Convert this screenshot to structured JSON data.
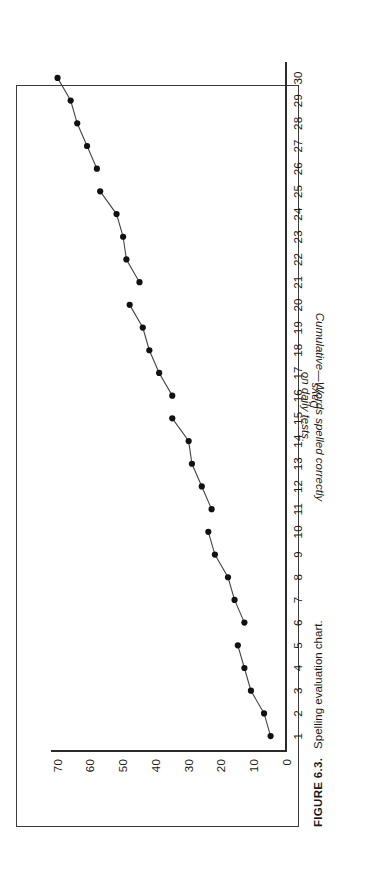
{
  "figure": {
    "caption_number": "FIGURE 6.3.",
    "caption_text": "Spelling evaluation chart.",
    "frame_color": "#3c3c3c",
    "rotation_note": "90-ccw"
  },
  "chart_data": {
    "type": "line",
    "title": "",
    "xlabel": "Days",
    "ylabel": "Cumulative—Words spelled correctly on daily tests.",
    "ylabel_line1": "Cumulative—Words spelled correctly",
    "ylabel_line2": "on daily tests.",
    "xlim": [
      0.3,
      30.7
    ],
    "ylim": [
      0,
      72
    ],
    "grid": false,
    "legend": null,
    "marker": "filled-circle",
    "marker_color": "#111111",
    "line_color": "#444444",
    "xticks": [
      "1",
      "2",
      "3",
      "4",
      "5",
      "6",
      "7",
      "8",
      "9",
      "10",
      "11",
      "12",
      "13",
      "14",
      "15",
      "16",
      "17",
      "18",
      "19",
      "20",
      "21",
      "22",
      "23",
      "24",
      "25",
      "26",
      "27",
      "28",
      "29",
      "30"
    ],
    "yticks": [
      "0",
      "10",
      "20",
      "30",
      "40",
      "50",
      "60",
      "70"
    ],
    "x": [
      1,
      2,
      3,
      4,
      5,
      6,
      7,
      8,
      9,
      10,
      11,
      12,
      13,
      14,
      15,
      16,
      17,
      18,
      19,
      20,
      21,
      22,
      23,
      24,
      25,
      26,
      27,
      28,
      29,
      30
    ],
    "values": [
      5,
      7,
      11,
      13,
      15,
      13,
      16,
      18,
      22,
      24,
      23,
      26,
      29,
      30,
      35,
      35,
      39,
      42,
      44,
      48,
      45,
      49,
      50,
      52,
      57,
      58,
      61,
      64,
      66,
      70
    ],
    "segment_breaks": [
      5,
      10,
      15,
      20,
      25
    ]
  }
}
